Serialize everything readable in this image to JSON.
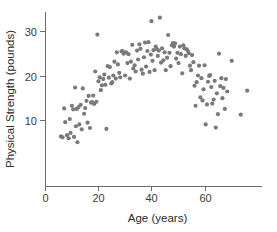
{
  "chart_data": {
    "type": "scatter",
    "title": "",
    "xlabel": "Age (years)",
    "ylabel": "Physical Strength (pounds)",
    "xlim": [
      0,
      82
    ],
    "ylim": [
      0,
      35
    ],
    "xticks": [
      0,
      20,
      40,
      60
    ],
    "yticks": [
      10,
      20,
      30
    ],
    "xtick_labels": [
      "0",
      "20",
      "40",
      "60"
    ],
    "ytick_labels": [
      "10",
      "20",
      "30"
    ],
    "grid": false,
    "legend": null,
    "marker": {
      "shape": "circle",
      "color": "#7a7a7a",
      "size_px": 2.1
    },
    "n_points": 148,
    "points": [
      [
        6.0,
        6.3
      ],
      [
        6.6,
        6.1
      ],
      [
        7.2,
        12.6
      ],
      [
        7.6,
        9.5
      ],
      [
        8.3,
        6.6
      ],
      [
        8.9,
        5.9
      ],
      [
        9.3,
        10.2
      ],
      [
        9.6,
        7.1
      ],
      [
        10.1,
        13.2
      ],
      [
        10.6,
        12.4
      ],
      [
        10.9,
        6.2
      ],
      [
        11.3,
        17.3
      ],
      [
        11.6,
        8.6
      ],
      [
        11.9,
        12.5
      ],
      [
        12.2,
        5.0
      ],
      [
        12.6,
        12.9
      ],
      [
        12.9,
        9.0
      ],
      [
        13.4,
        13.4
      ],
      [
        13.8,
        7.9
      ],
      [
        14.2,
        17.1
      ],
      [
        14.7,
        11.4
      ],
      [
        15.1,
        12.7
      ],
      [
        15.6,
        14.3
      ],
      [
        16.0,
        9.4
      ],
      [
        16.4,
        15.4
      ],
      [
        16.9,
        8.2
      ],
      [
        17.3,
        13.9
      ],
      [
        17.7,
        14.0
      ],
      [
        18.1,
        15.5
      ],
      [
        18.5,
        13.6
      ],
      [
        18.9,
        20.9
      ],
      [
        19.3,
        14.1
      ],
      [
        19.7,
        29.2
      ],
      [
        20.1,
        18.7
      ],
      [
        20.6,
        19.6
      ],
      [
        21.0,
        16.7
      ],
      [
        21.4,
        17.8
      ],
      [
        21.9,
        19.2
      ],
      [
        22.3,
        20.2
      ],
      [
        22.7,
        17.9
      ],
      [
        23.1,
        8.0
      ],
      [
        23.6,
        22.1
      ],
      [
        24.0,
        19.5
      ],
      [
        24.4,
        21.9
      ],
      [
        24.9,
        18.2
      ],
      [
        25.3,
        18.5
      ],
      [
        25.7,
        20.0
      ],
      [
        26.1,
        23.1
      ],
      [
        26.6,
        19.3
      ],
      [
        27.0,
        25.2
      ],
      [
        27.4,
        22.5
      ],
      [
        27.9,
        20.6
      ],
      [
        28.3,
        19.6
      ],
      [
        28.8,
        25.4
      ],
      [
        29.2,
        25.5
      ],
      [
        29.6,
        24.9
      ],
      [
        30.1,
        20.0
      ],
      [
        30.5,
        25.2
      ],
      [
        31.0,
        22.8
      ],
      [
        31.4,
        24.8
      ],
      [
        31.9,
        19.3
      ],
      [
        32.3,
        23.1
      ],
      [
        32.8,
        26.9
      ],
      [
        33.2,
        21.6
      ],
      [
        33.7,
        22.3
      ],
      [
        34.1,
        20.9
      ],
      [
        34.6,
        25.6
      ],
      [
        35.0,
        23.6
      ],
      [
        35.5,
        27.0
      ],
      [
        35.9,
        26.0
      ],
      [
        36.3,
        21.3
      ],
      [
        36.8,
        20.4
      ],
      [
        37.2,
        24.1
      ],
      [
        37.6,
        27.4
      ],
      [
        38.0,
        22.0
      ],
      [
        38.5,
        25.5
      ],
      [
        38.9,
        27.5
      ],
      [
        39.3,
        20.8
      ],
      [
        39.8,
        24.7
      ],
      [
        40.0,
        32.2
      ],
      [
        40.4,
        23.3
      ],
      [
        40.8,
        25.7
      ],
      [
        41.2,
        21.2
      ],
      [
        41.6,
        26.5
      ],
      [
        42.0,
        26.0
      ],
      [
        42.4,
        24.4
      ],
      [
        42.8,
        25.6
      ],
      [
        43.2,
        33.0
      ],
      [
        43.6,
        22.9
      ],
      [
        44.0,
        26.1
      ],
      [
        44.5,
        23.4
      ],
      [
        45.0,
        25.2
      ],
      [
        45.4,
        21.2
      ],
      [
        45.9,
        24.0
      ],
      [
        46.3,
        29.1
      ],
      [
        46.8,
        25.1
      ],
      [
        47.2,
        22.1
      ],
      [
        47.7,
        26.8
      ],
      [
        48.1,
        27.3
      ],
      [
        48.5,
        26.5
      ],
      [
        48.9,
        27.2
      ],
      [
        49.3,
        23.8
      ],
      [
        49.8,
        25.1
      ],
      [
        50.2,
        22.8
      ],
      [
        50.7,
        26.5
      ],
      [
        51.1,
        24.8
      ],
      [
        51.6,
        20.5
      ],
      [
        52.0,
        26.8
      ],
      [
        52.4,
        26.1
      ],
      [
        52.9,
        24.4
      ],
      [
        53.3,
        25.9
      ],
      [
        53.7,
        25.5
      ],
      [
        54.1,
        25.0
      ],
      [
        54.5,
        22.2
      ],
      [
        54.9,
        21.2
      ],
      [
        55.3,
        24.6
      ],
      [
        55.8,
        23.0
      ],
      [
        56.2,
        17.7
      ],
      [
        56.6,
        13.2
      ],
      [
        57.0,
        18.5
      ],
      [
        57.5,
        20.0
      ],
      [
        57.9,
        22.2
      ],
      [
        58.4,
        15.1
      ],
      [
        58.8,
        19.4
      ],
      [
        59.2,
        14.4
      ],
      [
        59.6,
        16.9
      ],
      [
        60.0,
        22.3
      ],
      [
        60.4,
        9.0
      ],
      [
        60.9,
        13.5
      ],
      [
        61.3,
        18.6
      ],
      [
        61.7,
        19.9
      ],
      [
        62.1,
        20.1
      ],
      [
        62.5,
        17.4
      ],
      [
        62.9,
        13.7
      ],
      [
        63.4,
        14.6
      ],
      [
        63.8,
        18.8
      ],
      [
        64.2,
        8.3
      ],
      [
        64.6,
        16.0
      ],
      [
        65.0,
        11.3
      ],
      [
        65.4,
        24.9
      ],
      [
        65.9,
        17.6
      ],
      [
        66.3,
        19.4
      ],
      [
        66.7,
        14.9
      ],
      [
        67.1,
        17.2
      ],
      [
        67.6,
        12.5
      ],
      [
        68.0,
        19.2
      ],
      [
        68.5,
        16.4
      ],
      [
        70.2,
        23.3
      ],
      [
        73.6,
        11.2
      ],
      [
        76.0,
        16.6
      ]
    ]
  },
  "axes_geometry": {
    "x_pixel_at_zero": 45,
    "x_pixels_per_unit": 2.66,
    "y_pixel_at_ten": 120,
    "y_pixels_per_unit": 4.45,
    "x_axis_y": 186,
    "y_axis_x": 45,
    "y_axis_top": 12,
    "x_axis_right": 262,
    "tick_length": 5
  }
}
